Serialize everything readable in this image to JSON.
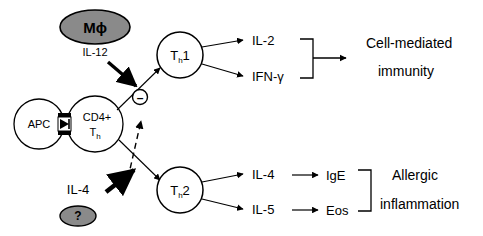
{
  "diagram": {
    "background_color": "#ffffff",
    "stroke_color": "#000000",
    "shaded_fill": "#8a8a8a",
    "cells": {
      "macrophage": {
        "label": "M",
        "symbol": "ϕ",
        "shape": "shaded-ellipse"
      },
      "apc": {
        "label": "APC",
        "shape": "circle"
      },
      "cd4": {
        "label_line1": "CD4+",
        "label_line2": "T",
        "label_sub": "h",
        "shape": "circle"
      },
      "th1": {
        "label": "T",
        "sub": "h",
        "num": "1",
        "shape": "circle"
      },
      "th2": {
        "label": "T",
        "sub": "h",
        "num": "2",
        "shape": "circle"
      },
      "unknown_source": {
        "label": "?",
        "shape": "shaded-ellipse"
      }
    },
    "cytokines": {
      "il12": "IL-12",
      "il4_source": "IL-4",
      "th1_out_1": "IL-2",
      "th1_out_2": "IFN-γ",
      "th2_out_1": "IL-4",
      "th2_out_2": "IL-5"
    },
    "mediators": {
      "ige": "IgE",
      "eos": "Eos"
    },
    "outcomes": {
      "top_line1": "Cell-mediated",
      "top_line2": "immunity",
      "bottom_line1": "Allergic",
      "bottom_line2": "inflammation"
    },
    "symbols": {
      "inhibition": "–",
      "inhibition_name": "minus-circle-icon"
    }
  }
}
